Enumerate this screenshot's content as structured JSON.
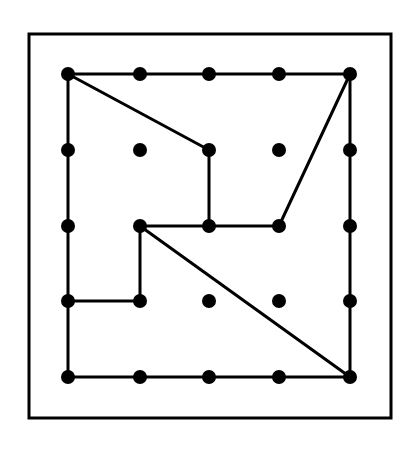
{
  "diagram": {
    "type": "geoboard",
    "grid": {
      "cols": 5,
      "rows": 5
    },
    "colors": {
      "background": "#ffffff",
      "ink": "#000000"
    },
    "frame": {
      "x": 29,
      "y": 34,
      "width": 362,
      "height": 384
    },
    "peg_x": [
      68,
      140,
      209,
      279,
      350
    ],
    "peg_y": [
      74,
      150,
      226,
      301,
      377
    ],
    "peg_radius": 7,
    "segments": [
      {
        "from": [
          0,
          0
        ],
        "to": [
          4,
          0
        ]
      },
      {
        "from": [
          4,
          0
        ],
        "to": [
          4,
          4
        ]
      },
      {
        "from": [
          0,
          4
        ],
        "to": [
          4,
          4
        ]
      },
      {
        "from": [
          0,
          0
        ],
        "to": [
          0,
          4
        ]
      },
      {
        "from": [
          0,
          0
        ],
        "to": [
          2,
          1
        ]
      },
      {
        "from": [
          2,
          1
        ],
        "to": [
          2,
          2
        ]
      },
      {
        "from": [
          1,
          2
        ],
        "to": [
          3,
          2
        ]
      },
      {
        "from": [
          3,
          2
        ],
        "to": [
          4,
          0
        ]
      },
      {
        "from": [
          1,
          2
        ],
        "to": [
          4,
          4
        ]
      },
      {
        "from": [
          1,
          2
        ],
        "to": [
          1,
          3
        ]
      },
      {
        "from": [
          0,
          3
        ],
        "to": [
          1,
          3
        ]
      }
    ]
  }
}
